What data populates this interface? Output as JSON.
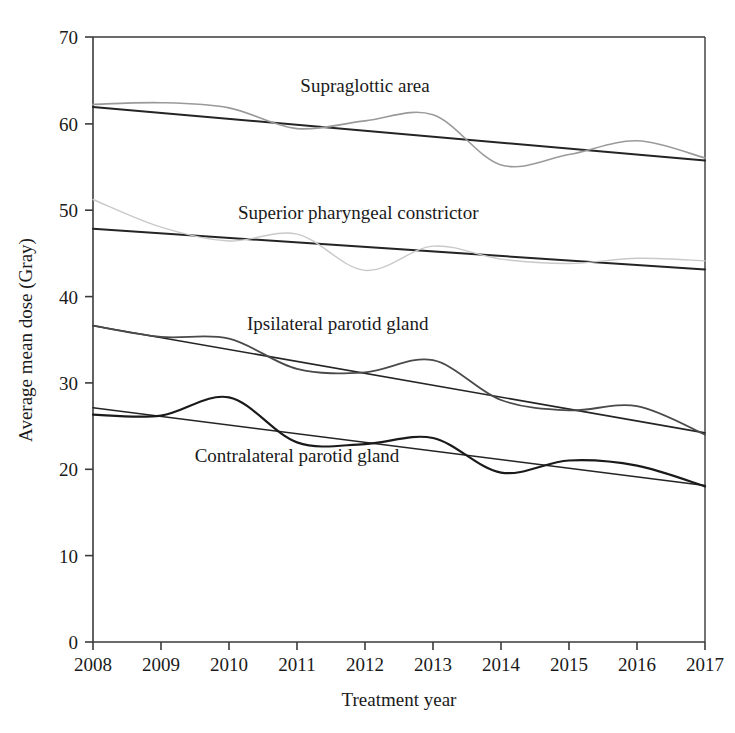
{
  "chart_data": {
    "type": "line",
    "title": "",
    "xlabel": "Treatment year",
    "ylabel": "Average mean dose (Gray)",
    "x": [
      2008,
      2009,
      2010,
      2011,
      2012,
      2013,
      2014,
      2015,
      2016,
      2017
    ],
    "xtick_labels": [
      "2008",
      "2009",
      "2010",
      "2011",
      "2012",
      "2013",
      "2014",
      "2015",
      "2016",
      "2017"
    ],
    "ytick_labels": [
      "0",
      "10",
      "20",
      "30",
      "40",
      "50",
      "60",
      "70"
    ],
    "ytick_values": [
      0,
      10,
      20,
      30,
      40,
      50,
      60,
      70
    ],
    "xlim": [
      2008,
      2017
    ],
    "ylim": [
      0,
      70
    ],
    "grid": false,
    "legend_position": "inline-annotations",
    "series": [
      {
        "name": "Supraglottic area",
        "label": "Supraglottic area",
        "color": "#9a9a9a",
        "linewidth": 1.6,
        "values": [
          62.2,
          62.4,
          61.8,
          59.4,
          60.3,
          61.0,
          55.2,
          56.4,
          58.0,
          56.0
        ],
        "trend": {
          "name": "Supraglottic area trend",
          "color": "#242424",
          "linewidth": 2.0,
          "start": 61.9,
          "end": 55.7
        }
      },
      {
        "name": "Superior pharyngeal constrictor",
        "label": "Superior pharyngeal constrictor",
        "color": "#c9c9c9",
        "linewidth": 1.4,
        "values": [
          51.2,
          48.0,
          46.4,
          47.2,
          43.0,
          45.8,
          44.3,
          43.8,
          44.4,
          44.1
        ],
        "trend": {
          "name": "Superior pharyngeal constrictor trend",
          "color": "#242424",
          "linewidth": 2.0,
          "start": 47.8,
          "end": 43.1
        }
      },
      {
        "name": "Ipsilateral parotid gland",
        "label": "Ipsilateral parotid gland",
        "color": "#4a4a4a",
        "linewidth": 1.8,
        "values": [
          36.6,
          35.3,
          35.1,
          31.6,
          31.2,
          32.6,
          28.0,
          26.8,
          27.3,
          24.0
        ],
        "trend": {
          "name": "Ipsilateral parotid gland trend",
          "color": "#242424",
          "linewidth": 1.6,
          "start": 36.6,
          "end": 24.2
        }
      },
      {
        "name": "Contralateral parotid gland",
        "label": "Contralateral parotid gland",
        "color": "#1a1a1a",
        "linewidth": 2.2,
        "values": [
          26.3,
          26.2,
          28.3,
          23.1,
          22.9,
          23.6,
          19.6,
          21.0,
          20.4,
          18.0
        ],
        "trend": {
          "name": "Contralateral parotid gland trend",
          "color": "#242424",
          "linewidth": 1.6,
          "start": 27.1,
          "end": 18.1
        }
      }
    ],
    "annotations": [
      {
        "text": "Supraglottic area",
        "x": 2012.0,
        "y": 63.6,
        "anchor": "middle"
      },
      {
        "text": "Superior pharyngeal constrictor",
        "x": 2011.9,
        "y": 49.0,
        "anchor": "middle"
      },
      {
        "text": "Ipsilateral parotid gland",
        "x": 2011.6,
        "y": 36.1,
        "anchor": "middle"
      },
      {
        "text": "Contralateral parotid gland",
        "x": 2011.0,
        "y": 20.8,
        "anchor": "middle"
      }
    ]
  }
}
